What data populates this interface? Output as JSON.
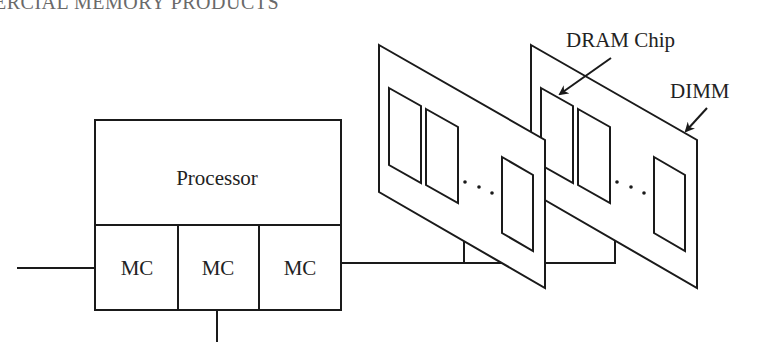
{
  "header": {
    "running_title": "ERCIAL MEMORY PRODUCTS"
  },
  "diagram": {
    "processor": {
      "label": "Processor",
      "memory_controllers": [
        {
          "label": "MC"
        },
        {
          "label": "MC"
        },
        {
          "label": "MC"
        }
      ]
    },
    "labels": {
      "dram_chip": "DRAM Chip",
      "dimm": "DIMM"
    },
    "ellipsis": "...",
    "dimm_count": 2,
    "chips_per_dimm_shown": 3,
    "colors": {
      "stroke": "#1a1a1a",
      "background": "#ffffff",
      "text": "#222222"
    }
  }
}
